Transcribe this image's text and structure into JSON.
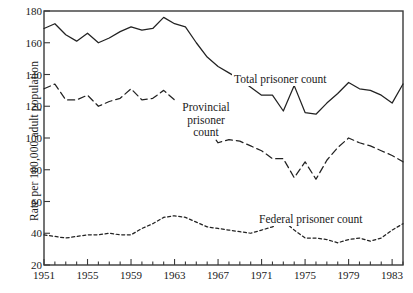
{
  "chart_data": {
    "type": "line",
    "title": "",
    "subtitle": "",
    "xlabel": "",
    "ylabel": "Rate per 100,000 adult population",
    "xlim": [
      1951,
      1984
    ],
    "ylim": [
      20,
      180
    ],
    "grid": false,
    "legend_position": "inline-annotations",
    "x_major_ticks": [
      1951,
      1955,
      1959,
      1963,
      1967,
      1971,
      1975,
      1979,
      1983
    ],
    "x_major_tick_labels": [
      "1951",
      "1955",
      "1959",
      "1963",
      "1967",
      "1971",
      "1975",
      "1979",
      "1983"
    ],
    "x_minor_tick_interval": 1,
    "y_ticks": [
      20,
      40,
      60,
      80,
      100,
      120,
      140,
      160,
      180
    ],
    "y_tick_labels": [
      "20",
      "40",
      "60",
      "80",
      "100",
      "120",
      "140",
      "160",
      "180"
    ],
    "x": [
      1951,
      1952,
      1953,
      1954,
      1955,
      1956,
      1957,
      1958,
      1959,
      1960,
      1961,
      1962,
      1963,
      1964,
      1965,
      1966,
      1967,
      1968,
      1969,
      1970,
      1971,
      1972,
      1973,
      1974,
      1975,
      1976,
      1977,
      1978,
      1979,
      1980,
      1981,
      1982,
      1983,
      1984
    ],
    "series": [
      {
        "name": "Total prisoner count",
        "style": "solid",
        "color": "#222222",
        "annotation": "Total prisoner count",
        "values": [
          169,
          172,
          165,
          161,
          166,
          160,
          163,
          167,
          170,
          168,
          169,
          176,
          172,
          170,
          160,
          151,
          145,
          141,
          137,
          132,
          127,
          127,
          117,
          133,
          116,
          115,
          122,
          128,
          135,
          131,
          130,
          127,
          122,
          134
        ]
      },
      {
        "name": "Provincial prisoner count",
        "style": "dashed",
        "color": "#222222",
        "annotation": "Provincial prisoner count",
        "values": [
          131,
          134,
          124,
          124,
          127,
          120,
          123,
          125,
          131,
          124,
          125,
          130,
          124,
          120,
          113,
          106,
          97,
          99,
          98,
          95,
          92,
          87,
          87,
          75,
          85,
          74,
          86,
          94,
          100,
          97,
          95,
          92,
          89,
          85
        ]
      },
      {
        "name": "Federal prisoner count",
        "style": "dotted",
        "color": "#222222",
        "annotation": "Federal prisoner count",
        "values": [
          39,
          38,
          37,
          38,
          39,
          39,
          40,
          39,
          39,
          43,
          46,
          50,
          51,
          50,
          47,
          44,
          43,
          42,
          41,
          40,
          42,
          44,
          48,
          42,
          37,
          37,
          36,
          34,
          36,
          37,
          35,
          37,
          42,
          46
        ]
      }
    ]
  },
  "annotations": {
    "total": "Total prisoner count",
    "federal": "Federal prisoner count",
    "provincial_line1": "Provincial",
    "provincial_line2": "prisoner",
    "provincial_line3": "count"
  }
}
